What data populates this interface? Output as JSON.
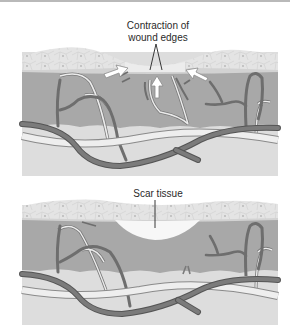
{
  "figure": {
    "panels": [
      {
        "id": "wound-contraction",
        "label_lines": [
          "Contraction of",
          "wound edges"
        ]
      },
      {
        "id": "scar",
        "label": "Scar tissue"
      }
    ]
  },
  "colors": {
    "epidermis": "#e6e6e6",
    "dermis": "#a9a9a9",
    "hypodermis": "#dcdcdc",
    "vessel_dark": "#6f6f6f",
    "vessel_light": "#e9e9e9",
    "scar": "#f7f7f7"
  }
}
